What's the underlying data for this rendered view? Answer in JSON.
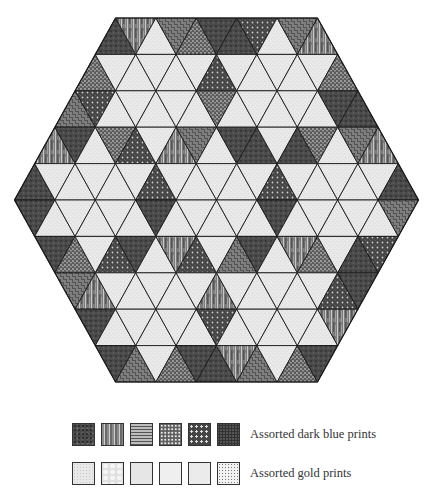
{
  "figure": {
    "type": "hexagon-triangle-quilt",
    "hexagon": {
      "center_x": 216.5,
      "top_y": 18,
      "row_height": 36.4,
      "triangle_base": 40.4,
      "top_edge_triangles": 5,
      "rows": 10
    },
    "colors": {
      "line": "#1a1a1a",
      "dark_base": "#4a4a4a",
      "light_base": "#e8e8e8"
    },
    "rows": [
      [
        "dark",
        "streaky",
        "light",
        "weave",
        "speckle",
        "dark",
        "dark",
        "dots",
        "light",
        "weave",
        "streaky"
      ],
      [
        "speckle",
        "light",
        "light",
        "light",
        "light",
        "light",
        "dots",
        "light",
        "light",
        "light",
        "light",
        "light",
        "speckle"
      ],
      [
        "weave",
        "dots",
        "light",
        "light",
        "light",
        "light",
        "light",
        "speckle",
        "light",
        "light",
        "light",
        "light",
        "light",
        "dark",
        "dark"
      ],
      [
        "streaky",
        "dark",
        "light",
        "speckle",
        "dots",
        "light",
        "streaky",
        "weave",
        "light",
        "dark",
        "dark",
        "light",
        "dark",
        "speckle",
        "light",
        "weave",
        "streaky"
      ],
      [
        "dark",
        "light",
        "light",
        "light",
        "light",
        "light",
        "dots",
        "light",
        "light",
        "light",
        "light",
        "light",
        "dots",
        "light",
        "light",
        "light",
        "light",
        "light",
        "dark"
      ],
      [
        "dark",
        "light",
        "light",
        "light",
        "light",
        "light",
        "dark",
        "light",
        "light",
        "light",
        "light",
        "light",
        "dark",
        "light",
        "light",
        "light",
        "light",
        "light",
        "weave"
      ],
      [
        "dark",
        "speckle",
        "light",
        "dots",
        "dark",
        "light",
        "streaky",
        "dots",
        "light",
        "weave",
        "dark",
        "light",
        "streaky",
        "speckle",
        "light",
        "dark",
        "dots"
      ],
      [
        "weave",
        "streaky",
        "light",
        "light",
        "light",
        "light",
        "light",
        "streaky",
        "light",
        "light",
        "light",
        "light",
        "light",
        "dots",
        "dark"
      ],
      [
        "dark",
        "light",
        "light",
        "light",
        "light",
        "light",
        "dots",
        "light",
        "light",
        "light",
        "light",
        "light",
        "streaky"
      ],
      [
        "dark",
        "weave",
        "light",
        "speckle",
        "dark",
        "dark",
        "streaky",
        "weave",
        "light",
        "speckle",
        "dark"
      ]
    ]
  },
  "legend": {
    "dark": {
      "label": "Assorted dark blue prints",
      "swatches": [
        "dark",
        "streaky",
        "weave",
        "speckle",
        "dots",
        "dark2"
      ]
    },
    "light": {
      "label": "Assorted gold prints",
      "swatches": [
        "light",
        "light2",
        "light3",
        "light4",
        "light5",
        "lightdots"
      ]
    }
  }
}
